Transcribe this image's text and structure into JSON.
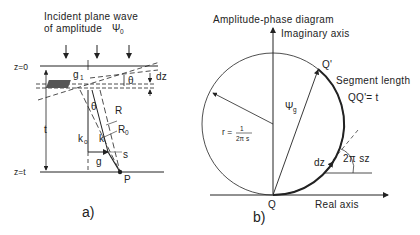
{
  "panel_a": {
    "title_line1": "Incident plane wave",
    "title_line2": "of amplitude",
    "psi0": "Ψ",
    "psi0_sub": "0",
    "z0": "z=0",
    "zt": "z=t",
    "t": "t",
    "g1": "g",
    "g1_sub": "1",
    "theta_top": "θ",
    "dz": "dz",
    "theta": "θ",
    "R": "R",
    "R0": "R",
    "R0_sub": "0",
    "k0": "k",
    "k0_sub": "o",
    "k": "k",
    "s": "s",
    "g": "g",
    "P": "P",
    "label": "a)"
  },
  "panel_b": {
    "title": "Amplitude-phase diagram",
    "imag_axis": "Imaginary axis",
    "real_axis": "Real axis",
    "Qprime": "Q'",
    "Q": "Q",
    "segment_line1": "Segment length",
    "segment_line2": "QQ'= t",
    "psig": "Ψ",
    "psig_sub": "g",
    "r_eq": "r =",
    "r_num": "1",
    "r_den": "2π s",
    "dz": "dz",
    "angle": "2π sz",
    "label": "b)"
  }
}
